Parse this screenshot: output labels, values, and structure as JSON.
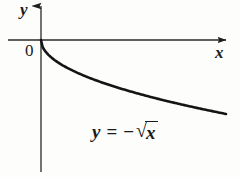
{
  "figure": {
    "background_color": "#fdfdfc",
    "ink_color": "#1a1a1a"
  },
  "labels": {
    "y_axis": "y",
    "x_axis": "x",
    "origin": "0"
  },
  "equation": {
    "lhs": "y",
    "relation": "=",
    "minus": "−",
    "radical_sign": "√",
    "radicand": "x",
    "full_text": "y = −√x"
  },
  "chart_data": {
    "type": "line",
    "title": "",
    "subtitle": "",
    "xlabel": "x",
    "ylabel": "y",
    "annotations": [
      {
        "text": "y = −√x",
        "x_px": 92,
        "y_px": 121
      },
      {
        "text": "0",
        "x_px": 25,
        "y_px": 42
      }
    ],
    "grid": false,
    "legend": null,
    "axes": {
      "origin_px": [
        41,
        40
      ],
      "x_axis_px": {
        "start": [
          8,
          40
        ],
        "end": [
          228,
          40
        ],
        "arrow": "right"
      },
      "y_axis_px": {
        "start": [
          41,
          172
        ],
        "end": [
          41,
          3
        ],
        "arrow": "up"
      },
      "xlim": [
        -0.2,
        10.0
      ],
      "ylim": [
        -7.2,
        2.0
      ]
    },
    "series": [
      {
        "name": "y = -sqrt(x)",
        "color": "#141414",
        "x": [
          0.0,
          0.1,
          0.25,
          0.5,
          0.75,
          1.0,
          1.5,
          2.0,
          2.5,
          3.0,
          3.5,
          4.0,
          4.5,
          5.0,
          5.5,
          6.0,
          6.5,
          7.0,
          7.5,
          8.0,
          8.5
        ],
        "y": [
          0.0,
          -0.32,
          -0.5,
          -0.71,
          -0.87,
          -1.0,
          -1.22,
          -1.41,
          -1.58,
          -1.73,
          -1.87,
          -2.0,
          -2.12,
          -2.24,
          -2.35,
          -2.45,
          -2.55,
          -2.65,
          -2.74,
          -2.83,
          -2.92
        ],
        "points_px": [
          [
            41,
            40
          ],
          [
            43,
            48
          ],
          [
            45,
            54
          ],
          [
            48,
            61
          ],
          [
            51,
            66
          ],
          [
            54,
            70
          ],
          [
            59,
            76
          ],
          [
            65,
            81
          ],
          [
            70,
            85
          ],
          [
            75,
            88
          ],
          [
            80,
            91
          ],
          [
            86,
            94
          ],
          [
            91,
            96
          ],
          [
            96,
            98
          ],
          [
            102,
            101
          ],
          [
            107,
            103
          ],
          [
            112,
            105
          ],
          [
            118,
            107
          ],
          [
            123,
            109
          ],
          [
            129,
            110
          ],
          [
            134,
            112
          ]
        ]
      }
    ]
  }
}
